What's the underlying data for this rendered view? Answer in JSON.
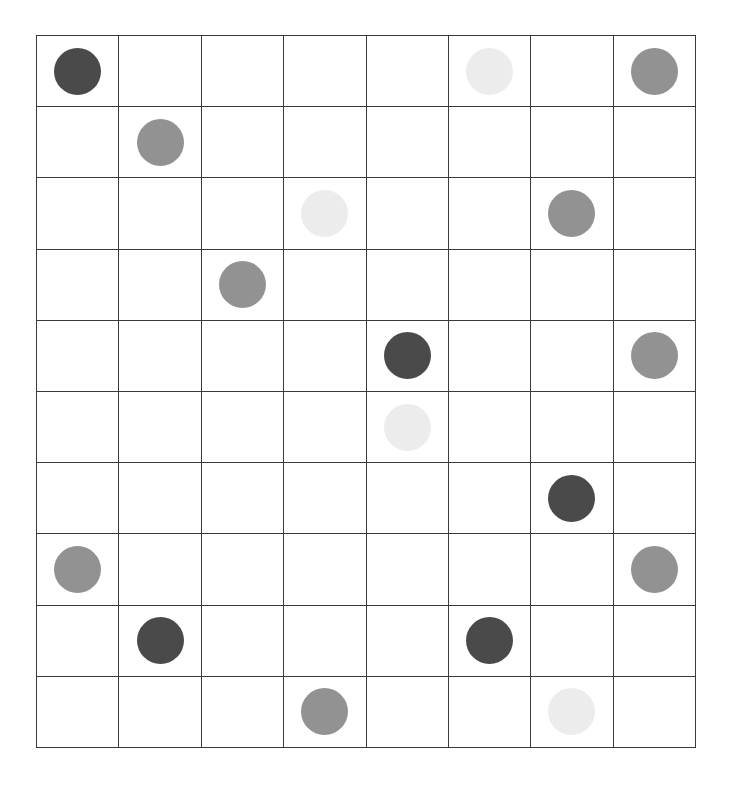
{
  "board": {
    "rows": 10,
    "cols": 8,
    "line_color": "#3a3a3a",
    "background": "#ffffff"
  },
  "shades": {
    "dark": "#4a4a4a",
    "medium": "#929292",
    "light": "#ececec"
  },
  "pieces": [
    {
      "row": 0,
      "col": 0,
      "shade": "dark"
    },
    {
      "row": 0,
      "col": 5,
      "shade": "light"
    },
    {
      "row": 0,
      "col": 7,
      "shade": "medium"
    },
    {
      "row": 1,
      "col": 1,
      "shade": "medium"
    },
    {
      "row": 2,
      "col": 3,
      "shade": "light"
    },
    {
      "row": 2,
      "col": 6,
      "shade": "medium"
    },
    {
      "row": 3,
      "col": 2,
      "shade": "medium"
    },
    {
      "row": 4,
      "col": 4,
      "shade": "dark"
    },
    {
      "row": 4,
      "col": 7,
      "shade": "medium"
    },
    {
      "row": 5,
      "col": 4,
      "shade": "light"
    },
    {
      "row": 6,
      "col": 6,
      "shade": "dark"
    },
    {
      "row": 7,
      "col": 0,
      "shade": "medium"
    },
    {
      "row": 7,
      "col": 7,
      "shade": "medium"
    },
    {
      "row": 8,
      "col": 1,
      "shade": "dark"
    },
    {
      "row": 8,
      "col": 5,
      "shade": "dark"
    },
    {
      "row": 9,
      "col": 3,
      "shade": "medium"
    },
    {
      "row": 9,
      "col": 6,
      "shade": "light"
    }
  ]
}
